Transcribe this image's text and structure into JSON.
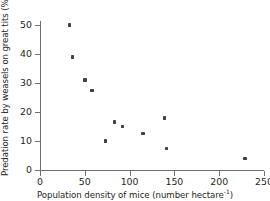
{
  "chart_data": {
    "type": "scatter",
    "title": "",
    "xlabel": "Population density of mice (number hectare",
    "xlabel_sup": "-1",
    "xlabel_tail": ")",
    "ylabel": "Predation rate by weasels on great tits (%)",
    "xlim": [
      0,
      250
    ],
    "ylim": [
      0,
      50
    ],
    "xticks": [
      0,
      50,
      100,
      150,
      200,
      250
    ],
    "yticks": [
      0,
      10,
      20,
      30,
      40,
      50
    ],
    "xtick_labels": [
      "0",
      "50",
      "100",
      "150",
      "200",
      "250"
    ],
    "ytick_labels": [
      "0",
      "10",
      "20",
      "30",
      "40",
      "50"
    ],
    "grid": false,
    "legend": false,
    "marker_color": "#414042",
    "axis_color": "#6d6e71",
    "points": [
      {
        "x": 33,
        "y": 50
      },
      {
        "x": 36,
        "y": 39
      },
      {
        "x": 50,
        "y": 31
      },
      {
        "x": 58,
        "y": 27.5
      },
      {
        "x": 73,
        "y": 10
      },
      {
        "x": 83,
        "y": 16.5
      },
      {
        "x": 92,
        "y": 15
      },
      {
        "x": 115,
        "y": 12.5
      },
      {
        "x": 139,
        "y": 18
      },
      {
        "x": 141,
        "y": 7.5
      },
      {
        "x": 229,
        "y": 4
      }
    ]
  }
}
